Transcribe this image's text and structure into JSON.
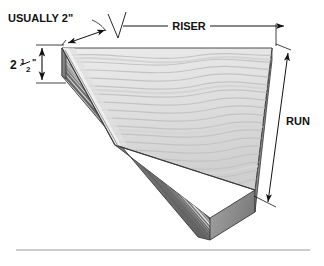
{
  "figure": {
    "type": "technical-illustration",
    "material_appearance": "laminated wood / plywood with wavy grain",
    "background_color": "#ffffff",
    "line_color": "#111111"
  },
  "labels": {
    "nosing": "USUALLY 2\"",
    "thickness": "2",
    "thickness_fraction_numerator": "1",
    "thickness_fraction_denominator": "2",
    "thickness_unit": "\"",
    "riser": "RISER",
    "run": "RUN"
  },
  "dimensions": [
    {
      "name": "nosing",
      "label": "USUALLY 2\"",
      "style": "leader-line with double arrow",
      "position": "top-left"
    },
    {
      "name": "thickness",
      "label": "2 1/2\"",
      "style": "vertical double-headed arrow between extension lines",
      "position": "left"
    },
    {
      "name": "riser",
      "label": "RISER",
      "style": "horizontal dimension line, arrow at right end",
      "position": "top"
    },
    {
      "name": "run",
      "label": "RUN",
      "style": "diagonal dimension line, arrows at both ends",
      "position": "right"
    }
  ],
  "break_line": {
    "name": "zigzag-break-line",
    "description": "V-shaped break symbol separating the nosing dimension from the riser dimension"
  },
  "footer_rule": {
    "name": "horizontal-rule",
    "visible": true
  },
  "colors": {
    "top_face_light": "#e9e9e9",
    "top_face_mid": "#d8d8d8",
    "grain_line": "#c2c2c2",
    "front_edge_dark": "#6f6f6f",
    "front_edge_mid": "#8c8c8c",
    "side_edge": "#9a9a9a",
    "ply_light": "#d0d0d0",
    "ply_dark": "#7a7a7a",
    "outline": "#3a3a3a",
    "rule": "#9b9b9b"
  }
}
